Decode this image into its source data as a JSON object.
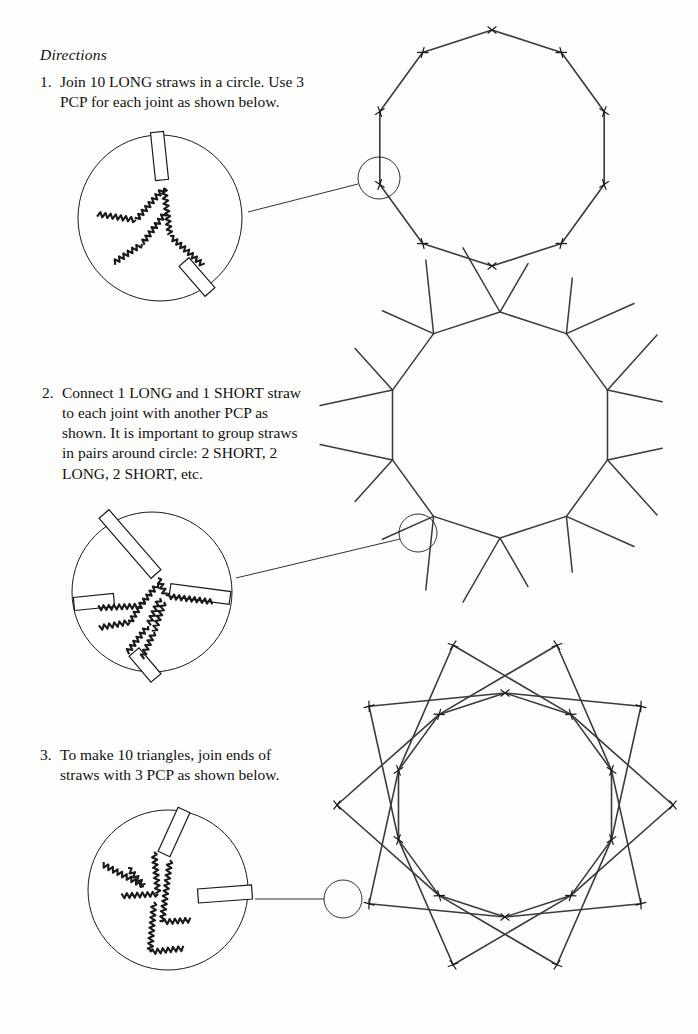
{
  "document": {
    "heading": "Directions",
    "page_width": 698,
    "page_height": 1034,
    "background_color": "#fdfdfc",
    "ink_color": "#1a1a1a"
  },
  "steps": [
    {
      "number": "1.",
      "text": "Join 10 LONG straws in a circle. Use 3 PCP for each joint as shown below."
    },
    {
      "number": "2.",
      "text": "Connect 1 LONG and 1 SHORT straw to each joint with another PCP as shown. It is important to group straws in pairs around circle: 2 SHORT, 2 LONG, 2 SHORT, etc."
    },
    {
      "number": "3.",
      "text": "To make 10 triangles, join ends of straws with 3 PCP as shown below."
    }
  ],
  "figures": [
    {
      "id": "figure-decagon",
      "caption_ref": "1.",
      "type": "decagon",
      "sides": 10,
      "center": [
        492,
        148
      ],
      "radius": 118,
      "rotation_deg": -90,
      "stroke": "#3a3a3a",
      "stroke_width": 1.6,
      "joint_marker": "cross-tick",
      "callout": {
        "circle_center": [
          379,
          178
        ],
        "circle_radius": 21,
        "leader_line": [
          [
            358,
            184
          ],
          [
            248,
            212
          ]
        ]
      },
      "detail_bubble": {
        "center": [
          160,
          218
        ],
        "radius_x": 82,
        "radius_y": 83,
        "straw_count": 2,
        "pcp_count": 3,
        "label": "joint-detail-3-pcp"
      }
    },
    {
      "id": "figure-spoked-decagon",
      "caption_ref": "2.",
      "type": "decagon-with-rays",
      "sides": 10,
      "center": [
        500,
        425
      ],
      "radius": 113,
      "rotation_deg": -90,
      "rays_per_vertex": 2,
      "ray_long_length": 74,
      "ray_short_length": 56,
      "ray_spread_deg": 30,
      "stroke": "#3a3a3a",
      "stroke_width": 1.5,
      "callout": {
        "circle_center": [
          418,
          533
        ],
        "circle_radius": 19,
        "leader_line": [
          [
            400,
            539
          ],
          [
            236,
            578
          ]
        ]
      },
      "detail_bubble": {
        "center": [
          152,
          592
        ],
        "radius_x": 80,
        "radius_y": 80,
        "straw_count": 4,
        "pcp_count": 4,
        "label": "joint-detail-4-straws"
      }
    },
    {
      "id": "figure-ten-point-star",
      "caption_ref": "3.",
      "type": "star-decagram",
      "points": 10,
      "center": [
        505,
        805
      ],
      "inner_radius": 112,
      "outer_radius": 168,
      "rotation_deg": -90,
      "skip": 3,
      "stroke": "#3a3a3a",
      "stroke_width": 1.6,
      "joint_marker": "cross-tick",
      "callout": {
        "circle_center": [
          343,
          899
        ],
        "circle_radius": 19,
        "leader_line": [
          [
            324,
            899
          ],
          [
            255,
            899
          ]
        ]
      },
      "detail_bubble": {
        "center": [
          168,
          890
        ],
        "radius_x": 80,
        "radius_y": 80,
        "straw_count": 2,
        "pcp_count": 3,
        "label": "joint-detail-triangle-tip"
      }
    }
  ],
  "legend_terms": {
    "pcp": "PCP",
    "long": "LONG",
    "short": "SHORT"
  }
}
